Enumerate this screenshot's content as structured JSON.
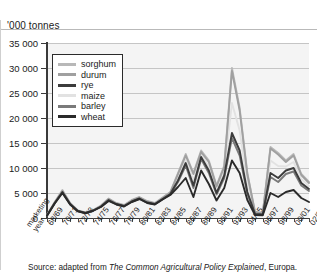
{
  "axis_title": "'000 tonnes",
  "source": {
    "prefix": "Source: adapted from ",
    "title": "The Common Agricultural Policy Explained",
    "suffix": ", Europa."
  },
  "legend": {
    "items": [
      {
        "label": "sorghum",
        "color": "#b8b8b8"
      },
      {
        "label": "durum",
        "color": "#a0a0a0"
      },
      {
        "label": "rye",
        "color": "#3c3c3c"
      },
      {
        "label": "maize",
        "color": "#e2e2e2"
      },
      {
        "label": "barley",
        "color": "#7a7a7a"
      },
      {
        "label": "wheat",
        "color": "#2a2a2a"
      }
    ]
  },
  "chart_data": {
    "type": "line",
    "title": "",
    "xlabel": "marketing year",
    "ylabel": "'000 tonnes",
    "ylim": [
      0,
      35000
    ],
    "ytick_labels": [
      "35 000",
      "30 000",
      "25 000",
      "20 000",
      "15 000",
      "10 000",
      "5 000",
      "0"
    ],
    "ytick_values": [
      35000,
      30000,
      25000,
      20000,
      15000,
      10000,
      5000,
      0
    ],
    "grid": true,
    "legend_position": "top-left",
    "x": [
      "68/69",
      "69/70",
      "70/71",
      "71/72",
      "72/73",
      "73/74",
      "74/75",
      "75/76",
      "76/77",
      "77/78",
      "78/79",
      "79/80",
      "80/81",
      "81/82",
      "82/83",
      "83/84",
      "84/85",
      "85/86",
      "86/87",
      "87/88",
      "88/89",
      "89/90",
      "90/91",
      "91/92",
      "92/93",
      "93/94",
      "94/95",
      "95/96",
      "96/97",
      "97/98",
      "98/99",
      "99/00",
      "00/01",
      "01/02",
      "02/03"
    ],
    "xtick_labels_shown": [
      "68/69",
      "70/71",
      "72/73",
      "74/75",
      "76/77",
      "78/79",
      "80/81",
      "82/83",
      "84/85",
      "86/87",
      "88/89",
      "90/91",
      "92/93",
      "94/95",
      "96/97",
      "98/99",
      "00/01",
      "02/03"
    ],
    "series": [
      {
        "name": "sorghum",
        "color": "#b8b8b8",
        "values": [
          600,
          3200,
          5600,
          3000,
          1500,
          1100,
          1600,
          2500,
          3900,
          3000,
          2600,
          3600,
          4200,
          3400,
          3000,
          4100,
          5200,
          9000,
          12800,
          9000,
          13500,
          11500,
          6500,
          10500,
          30000,
          22000,
          9000,
          1200,
          1000,
          14200,
          13000,
          11500,
          12800,
          8800,
          7200
        ]
      },
      {
        "name": "durum",
        "color": "#a0a0a0",
        "values": [
          550,
          3100,
          5400,
          2900,
          1450,
          1050,
          1550,
          2400,
          3800,
          2900,
          2500,
          3500,
          4100,
          3300,
          2900,
          4000,
          5100,
          8800,
          12500,
          8800,
          13200,
          11200,
          6300,
          10200,
          29400,
          21500,
          8700,
          1100,
          950,
          13900,
          12700,
          11200,
          12500,
          8600,
          7000
        ]
      },
      {
        "name": "rye",
        "color": "#3c3c3c",
        "values": [
          500,
          3000,
          5200,
          2800,
          1400,
          1000,
          1500,
          2300,
          3600,
          2800,
          2400,
          3300,
          3900,
          3100,
          2800,
          3800,
          4800,
          7500,
          11000,
          6500,
          12200,
          9500,
          5000,
          8500,
          17000,
          13500,
          5200,
          800,
          700,
          9000,
          8000,
          9500,
          10000,
          7000,
          5800
        ]
      },
      {
        "name": "maize",
        "color": "#e2e2e2",
        "values": [
          520,
          3050,
          5300,
          2850,
          1420,
          1020,
          1520,
          2350,
          3700,
          2850,
          2450,
          3400,
          4000,
          3200,
          2850,
          3900,
          4950,
          8100,
          11700,
          7600,
          12700,
          10300,
          5600,
          9300,
          23000,
          17500,
          7000,
          950,
          820,
          11500,
          10400,
          10300,
          11200,
          7800,
          6400
        ]
      },
      {
        "name": "barley",
        "color": "#7a7a7a",
        "values": [
          480,
          2950,
          5100,
          2750,
          1380,
          980,
          1480,
          2250,
          3500,
          2750,
          2350,
          3250,
          3850,
          3050,
          2750,
          3750,
          4700,
          7200,
          10500,
          6000,
          11800,
          9000,
          4700,
          8000,
          16000,
          12500,
          4800,
          750,
          650,
          8200,
          7200,
          8800,
          9300,
          6500,
          5400
        ]
      },
      {
        "name": "wheat",
        "color": "#2a2a2a",
        "values": [
          450,
          2900,
          5000,
          2700,
          1350,
          950,
          1450,
          2200,
          3400,
          2700,
          2300,
          3200,
          3800,
          3000,
          2700,
          3700,
          4600,
          6200,
          8000,
          4200,
          9500,
          6800,
          3500,
          6000,
          11500,
          9000,
          3600,
          600,
          550,
          5000,
          4200,
          5200,
          5600,
          4000,
          3200
        ]
      }
    ]
  }
}
